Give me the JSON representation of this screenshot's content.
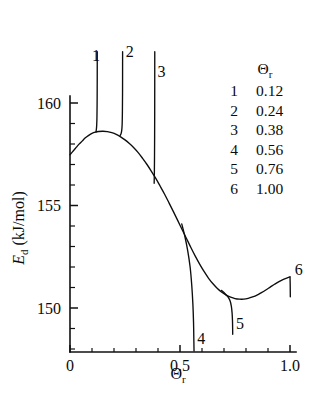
{
  "chart_data": {
    "type": "line",
    "title": "",
    "xlabel": "Θr",
    "ylabel": "Ed (kJ/mol)",
    "xlabel_main": "Θ",
    "xlabel_sub": "r",
    "ylabel_main": "E",
    "ylabel_sub": "d",
    "ylabel_unit": "(kJ/mol)",
    "xlim": [
      0,
      1.07
    ],
    "ylim": [
      147.9,
      162.5
    ],
    "grid": false,
    "legend_position": "upper-right-inside",
    "x_major_ticks": [
      0,
      0.5,
      1.0
    ],
    "x_major_tick_labels": [
      "0",
      "0.5",
      "1.0"
    ],
    "x_minor_ticks": [
      0.1,
      0.2,
      0.3,
      0.4,
      0.6,
      0.7,
      0.8,
      0.9
    ],
    "y_major_ticks": [
      150,
      155,
      160
    ],
    "y_major_tick_labels": [
      "150",
      "155",
      "160"
    ],
    "y_minor_ticks": [
      148,
      149,
      151,
      152,
      153,
      154,
      156,
      157,
      158,
      159,
      161,
      162
    ],
    "series": [
      {
        "name": "envelope",
        "label": "",
        "points": [
          [
            0.0,
            157.48
          ],
          [
            0.012,
            157.63
          ],
          [
            0.025,
            157.79
          ],
          [
            0.04,
            157.98
          ],
          [
            0.055,
            158.14
          ],
          [
            0.07,
            158.3
          ],
          [
            0.085,
            158.42
          ],
          [
            0.1,
            158.52
          ],
          [
            0.115,
            158.58
          ],
          [
            0.13,
            158.61
          ],
          [
            0.15,
            158.62
          ],
          [
            0.17,
            158.6
          ],
          [
            0.19,
            158.55
          ],
          [
            0.21,
            158.47
          ],
          [
            0.23,
            158.35
          ],
          [
            0.25,
            158.2
          ],
          [
            0.27,
            158.02
          ],
          [
            0.29,
            157.82
          ],
          [
            0.31,
            157.58
          ],
          [
            0.33,
            157.3
          ],
          [
            0.35,
            157.0
          ],
          [
            0.37,
            156.67
          ],
          [
            0.39,
            156.32
          ],
          [
            0.41,
            155.94
          ],
          [
            0.43,
            155.55
          ],
          [
            0.45,
            155.13
          ],
          [
            0.47,
            154.7
          ],
          [
            0.49,
            154.26
          ],
          [
            0.51,
            153.82
          ],
          [
            0.53,
            153.38
          ],
          [
            0.55,
            152.94
          ],
          [
            0.57,
            152.52
          ],
          [
            0.59,
            152.13
          ],
          [
            0.61,
            151.77
          ],
          [
            0.63,
            151.45
          ],
          [
            0.65,
            151.18
          ],
          [
            0.67,
            150.95
          ],
          [
            0.69,
            150.77
          ],
          [
            0.71,
            150.63
          ],
          [
            0.73,
            150.53
          ],
          [
            0.75,
            150.46
          ],
          [
            0.77,
            150.43
          ],
          [
            0.79,
            150.43
          ],
          [
            0.81,
            150.47
          ],
          [
            0.83,
            150.54
          ],
          [
            0.85,
            150.63
          ],
          [
            0.87,
            150.75
          ],
          [
            0.89,
            150.88
          ],
          [
            0.91,
            151.02
          ],
          [
            0.93,
            151.16
          ],
          [
            0.95,
            151.29
          ],
          [
            0.97,
            151.4
          ],
          [
            0.99,
            151.48
          ],
          [
            1.0,
            151.52
          ]
        ]
      },
      {
        "name": "branch-1",
        "label": "1",
        "theta_r": "0.12",
        "points": [
          [
            0.118,
            158.58
          ],
          [
            0.12,
            158.73
          ],
          [
            0.1215,
            158.95
          ],
          [
            0.1225,
            159.3
          ],
          [
            0.1232,
            159.9
          ],
          [
            0.1236,
            160.7
          ],
          [
            0.1238,
            161.4
          ],
          [
            0.1239,
            162.5
          ]
        ]
      },
      {
        "name": "branch-2",
        "label": "2",
        "theta_r": "0.24",
        "points": [
          [
            0.228,
            158.42
          ],
          [
            0.2325,
            158.52
          ],
          [
            0.2355,
            158.7
          ],
          [
            0.2372,
            159.0
          ],
          [
            0.2382,
            159.6
          ],
          [
            0.2388,
            160.5
          ],
          [
            0.239,
            161.6
          ],
          [
            0.2391,
            162.5
          ]
        ]
      },
      {
        "name": "branch-3",
        "label": "3",
        "theta_r": "0.38",
        "points": [
          [
            0.3825,
            156.08
          ],
          [
            0.3835,
            156.6
          ],
          [
            0.3842,
            157.4
          ],
          [
            0.3847,
            158.4
          ],
          [
            0.385,
            159.6
          ],
          [
            0.3852,
            161.0
          ],
          [
            0.3853,
            162.5
          ]
        ]
      },
      {
        "name": "branch-4",
        "label": "4",
        "theta_r": "0.56",
        "points": [
          [
            0.508,
            154.1
          ],
          [
            0.522,
            153.5
          ],
          [
            0.535,
            152.8
          ],
          [
            0.546,
            152.0
          ],
          [
            0.5535,
            151.1
          ],
          [
            0.5585,
            150.2
          ],
          [
            0.5615,
            149.3
          ],
          [
            0.563,
            148.4
          ],
          [
            0.5638,
            147.9
          ]
        ]
      },
      {
        "name": "branch-5",
        "label": "5",
        "theta_r": "0.76",
        "points": [
          [
            0.688,
            150.86
          ],
          [
            0.705,
            150.7
          ],
          [
            0.718,
            150.54
          ],
          [
            0.7275,
            150.35
          ],
          [
            0.7335,
            150.08
          ],
          [
            0.7368,
            149.75
          ],
          [
            0.7385,
            149.4
          ],
          [
            0.7392,
            149.05
          ],
          [
            0.7396,
            148.72
          ]
        ]
      },
      {
        "name": "branch-6",
        "label": "6",
        "theta_r": "1.00",
        "points": [
          [
            1.0,
            151.52
          ],
          [
            1.0008,
            151.2
          ],
          [
            1.0012,
            150.85
          ],
          [
            1.0014,
            150.55
          ]
        ]
      }
    ],
    "branch_labels": [
      {
        "id": "1",
        "x": 0.1,
        "y": 162.05
      },
      {
        "id": "2",
        "x": 0.253,
        "y": 162.25
      },
      {
        "id": "3",
        "x": 0.398,
        "y": 161.25
      },
      {
        "id": "4",
        "x": 0.578,
        "y": 148.25
      },
      {
        "id": "5",
        "x": 0.755,
        "y": 149.0
      },
      {
        "id": "6",
        "x": 1.022,
        "y": 151.6
      }
    ],
    "legend": {
      "header_main": "Θ",
      "header_sub": "r",
      "rows": [
        {
          "id": "1",
          "value": "0.12"
        },
        {
          "id": "2",
          "value": "0.24"
        },
        {
          "id": "3",
          "value": "0.38"
        },
        {
          "id": "4",
          "value": "0.56"
        },
        {
          "id": "5",
          "value": "0.76"
        },
        {
          "id": "6",
          "value": "1.00"
        }
      ]
    }
  }
}
